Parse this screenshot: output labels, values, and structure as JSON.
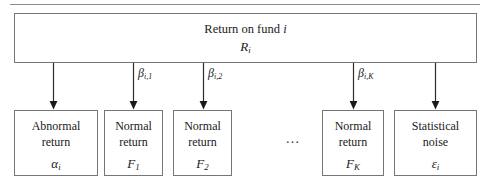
{
  "figure": {
    "name": "return-decomposition-diagram",
    "top_rule_color": "#8c8c8c",
    "box_border_color": "#767676",
    "text_color": "#1a1a1a"
  },
  "top_box": {
    "line1_text": "Return on fund ",
    "line1_italic": "i",
    "symbol": "R",
    "symbol_subscript": "i"
  },
  "ellipsis": {
    "text": "…"
  },
  "edges": [
    {
      "label_base": "",
      "label_sub": "",
      "arrow_x": 53
    },
    {
      "label_base": "β",
      "label_sub": "i,1",
      "arrow_x": 133
    },
    {
      "label_base": "β",
      "label_sub": "i,2",
      "arrow_x": 203
    },
    {
      "label_base": "β",
      "label_sub": "i,K",
      "arrow_x": 353
    },
    {
      "label_base": "",
      "label_sub": "",
      "arrow_x": 435
    }
  ],
  "beta_labels": [
    {
      "base": "β",
      "sub": "i,1"
    },
    {
      "base": "β",
      "sub": "i,2"
    },
    {
      "base": "β",
      "sub": "i,K"
    }
  ],
  "leaves": [
    {
      "word1": "Abnormal",
      "word2": "return",
      "symbol": "α",
      "symbol_subscript": "i"
    },
    {
      "word1": "Normal",
      "word2": "return",
      "symbol": "F",
      "symbol_subscript": "1"
    },
    {
      "word1": "Normal",
      "word2": "return",
      "symbol": "F",
      "symbol_subscript": "2"
    },
    {
      "word1": "Normal",
      "word2": "return",
      "symbol": "F",
      "symbol_subscript": "K"
    },
    {
      "word1": "Statistical",
      "word2": "noise",
      "symbol": "ε",
      "symbol_subscript": "i"
    }
  ]
}
